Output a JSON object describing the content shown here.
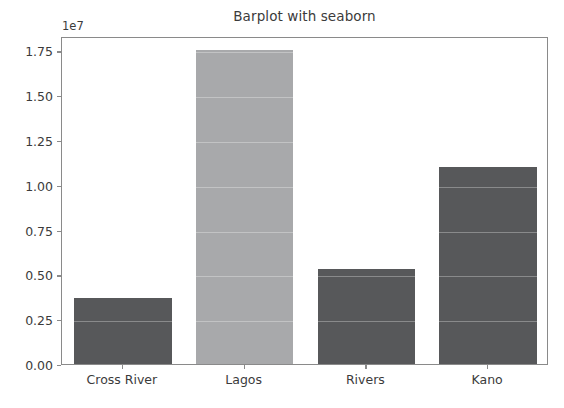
{
  "chart_data": {
    "type": "bar",
    "title": "Barplot with seaborn",
    "xlabel": "",
    "ylabel": "",
    "categories": [
      "Cross River",
      "Lagos",
      "Rivers",
      "Kano"
    ],
    "values": [
      3700000,
      17500000,
      5300000,
      11000000
    ],
    "bar_colors": [
      "#57585a",
      "#a8a9ab",
      "#57585a",
      "#57585a"
    ],
    "ylim": [
      0,
      18300000
    ],
    "y_offset_text": "1e7",
    "y_ticks": [
      0,
      2500000,
      5000000,
      7500000,
      10000000,
      12500000,
      15000000,
      17500000
    ],
    "y_tick_labels": [
      "0.00",
      "0.25",
      "0.50",
      "0.75",
      "1.00",
      "1.25",
      "1.50",
      "1.75"
    ],
    "grid": true,
    "legend": null,
    "axis_color": "#8a8a8a",
    "text_color": "#3b3b3b",
    "background": "#ffffff"
  }
}
